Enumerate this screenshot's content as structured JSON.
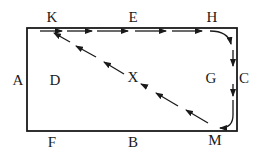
{
  "diagram": {
    "type": "path-on-rectangle",
    "colors": {
      "stroke": "#1a1a1a",
      "background": "#ffffff"
    },
    "rectangle": {
      "left": 27,
      "top": 28,
      "right": 237,
      "bottom": 131
    },
    "labels": [
      {
        "id": "K",
        "text": "K",
        "x": 52,
        "y": 17
      },
      {
        "id": "E",
        "text": "E",
        "x": 133,
        "y": 17
      },
      {
        "id": "H",
        "text": "H",
        "x": 212,
        "y": 17
      },
      {
        "id": "A",
        "text": "A",
        "x": 18,
        "y": 80
      },
      {
        "id": "D",
        "text": "D",
        "x": 55,
        "y": 80
      },
      {
        "id": "X",
        "text": "X",
        "x": 133,
        "y": 77
      },
      {
        "id": "G",
        "text": "G",
        "x": 211,
        "y": 78
      },
      {
        "id": "C",
        "text": "C",
        "x": 244,
        "y": 78
      },
      {
        "id": "F",
        "text": "F",
        "x": 52,
        "y": 142
      },
      {
        "id": "B",
        "text": "B",
        "x": 133,
        "y": 142
      },
      {
        "id": "M",
        "text": "M",
        "x": 215,
        "y": 140
      }
    ],
    "path": {
      "description": "Dashed arrowed route K → E → H → (curve) → C/G → (curve) → M → X → K",
      "segments": [
        {
          "from": "K",
          "to": "H",
          "style": "dashed",
          "direction": "right",
          "along": "top edge"
        },
        {
          "from": "H",
          "to": "M",
          "style": "solid-curved",
          "direction": "down",
          "along": "right edge"
        },
        {
          "from": "M",
          "to": "K",
          "style": "dashed",
          "direction": "up-left",
          "via": "X"
        }
      ]
    }
  }
}
